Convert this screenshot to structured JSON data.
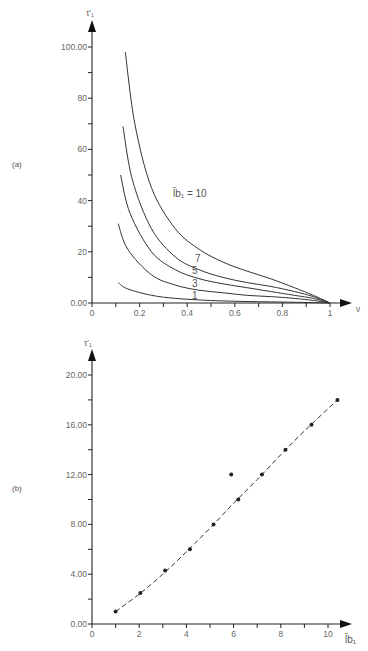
{
  "chart_data": [
    {
      "panel": "(a)",
      "type": "line",
      "title": "",
      "xlabel": "ν",
      "ylabel": "τ'₁",
      "xlim": [
        0,
        1
      ],
      "ylim": [
        0,
        100
      ],
      "x_ticks": [
        "0",
        "0.2",
        "0.4",
        "0.6",
        "0.8",
        "1"
      ],
      "y_ticks": [
        "0.00",
        "20",
        "40",
        "60",
        "80",
        "100.00"
      ],
      "grid": false,
      "legend": "inline labels",
      "annotation": "l̄b₁ = 10",
      "series": [
        {
          "name": "10",
          "x": [
            0.14,
            0.18,
            0.25,
            0.35,
            0.45,
            0.55,
            0.65,
            0.75,
            0.85,
            0.93,
            1.0
          ],
          "y": [
            98,
            70,
            45,
            29,
            21,
            16,
            12.5,
            9.5,
            6,
            3,
            0
          ]
        },
        {
          "name": "7",
          "x": [
            0.13,
            0.17,
            0.25,
            0.35,
            0.45,
            0.55,
            0.65,
            0.75,
            0.85,
            0.93,
            1.0
          ],
          "y": [
            69,
            48,
            29,
            18,
            13,
            10,
            8,
            6.5,
            4.5,
            2.5,
            0
          ]
        },
        {
          "name": "5",
          "x": [
            0.12,
            0.16,
            0.25,
            0.35,
            0.45,
            0.55,
            0.65,
            0.75,
            0.85,
            0.93,
            1.0
          ],
          "y": [
            50,
            35,
            20,
            13,
            9.5,
            7.5,
            6,
            4.5,
            3,
            1.8,
            0
          ]
        },
        {
          "name": "3",
          "x": [
            0.11,
            0.15,
            0.25,
            0.35,
            0.45,
            0.55,
            0.65,
            0.75,
            0.85,
            0.93,
            1.0
          ],
          "y": [
            31,
            21,
            11,
            7,
            5,
            4,
            3,
            2.5,
            1.8,
            1,
            0
          ]
        },
        {
          "name": "1",
          "x": [
            0.11,
            0.15,
            0.25,
            0.35,
            0.45,
            0.55,
            0.7,
            0.85,
            1.0
          ],
          "y": [
            8,
            5.5,
            3,
            1.8,
            1.2,
            0.8,
            0.5,
            0.3,
            0
          ]
        }
      ]
    },
    {
      "panel": "(b)",
      "type": "scatter",
      "title": "",
      "xlabel": "l̄b₁",
      "ylabel": "τ'₁",
      "xlim": [
        0,
        10
      ],
      "ylim": [
        0,
        20
      ],
      "x_ticks": [
        "0",
        "2",
        "4",
        "6",
        "8",
        "10"
      ],
      "y_ticks": [
        "0.00",
        "4.00",
        "8.00",
        "12.00",
        "16.00",
        "20.00"
      ],
      "grid": false,
      "series": [
        {
          "name": "points",
          "x": [
            1.0,
            2.05,
            3.1,
            4.15,
            5.15,
            6.2,
            5.9,
            7.2,
            8.2,
            9.3,
            10.4
          ],
          "y": [
            1.0,
            2.5,
            4.3,
            6.0,
            8.0,
            10.0,
            12.0,
            12.0,
            14.0,
            16.0,
            18.0
          ]
        },
        {
          "name": "fit (dashed)",
          "x": [
            1.0,
            2.0,
            3.0,
            4.0,
            5.0,
            6.0,
            7.0,
            8.0,
            9.0,
            10.4
          ],
          "y": [
            1.0,
            2.4,
            4.0,
            5.8,
            7.7,
            9.7,
            11.6,
            13.6,
            15.5,
            18.0
          ]
        }
      ]
    }
  ],
  "labels": {
    "panel_a": "(a)",
    "panel_b": "(b)",
    "a_ylabel": "τ'₁",
    "a_xlabel": "ν",
    "b_ylabel": "τ'₁",
    "b_xlabel": "l̄b₁",
    "a_annotation": "l̄b₁ = 10",
    "curve_labels": [
      "7",
      "5",
      "3",
      "1"
    ]
  }
}
